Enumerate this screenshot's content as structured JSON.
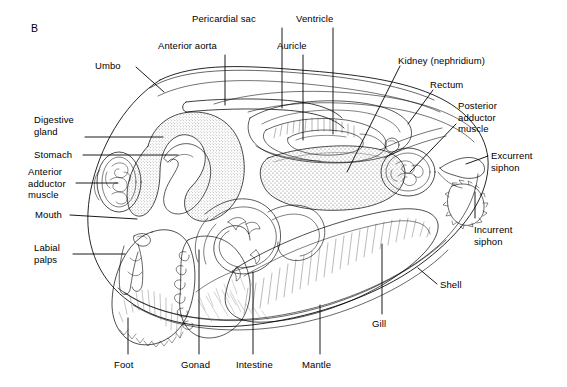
{
  "figure": {
    "panel_letter": "B",
    "background_color": "#ffffff",
    "line_color": "#000000",
    "stipple_color": "#6b6b6b"
  },
  "labels": [
    {
      "id": "pericardial-sac",
      "text": "Pericardial sac",
      "x": 233,
      "y": 14,
      "align": "left",
      "lines": 1
    },
    {
      "id": "ventricle",
      "text": "Ventricle",
      "x": 297,
      "y": 14,
      "align": "left",
      "lines": 1
    },
    {
      "id": "anterior-aorta",
      "text": "Anterior aorta",
      "x": 160,
      "y": 41,
      "align": "left",
      "lines": 1
    },
    {
      "id": "auricle",
      "text": "Auricle",
      "x": 280,
      "y": 41,
      "align": "left",
      "lines": 1
    },
    {
      "id": "umbo",
      "text": "Umbo",
      "x": 95,
      "y": 61,
      "align": "left",
      "lines": 1
    },
    {
      "id": "kidney-nephridium",
      "text": "Kidney (nephridium)",
      "x": 399,
      "y": 56,
      "align": "left",
      "lines": 1
    },
    {
      "id": "rectum",
      "text": "Rectum",
      "x": 432,
      "y": 80,
      "align": "left",
      "lines": 1
    },
    {
      "id": "posterior-adductor-muscle",
      "text": "Posterior\nadductor\nmuscle",
      "x": 459,
      "y": 105,
      "align": "left",
      "lines": 3
    },
    {
      "id": "digestive-gland",
      "text": "Digestive\ngland",
      "x": 35,
      "y": 117,
      "align": "left",
      "lines": 2
    },
    {
      "id": "stomach",
      "text": "Stomach",
      "x": 35,
      "y": 150,
      "align": "left",
      "lines": 1
    },
    {
      "id": "excurrent-siphon",
      "text": "Excurrent\nsiphon",
      "x": 491,
      "y": 150,
      "align": "left",
      "lines": 2
    },
    {
      "id": "anterior-adductor-muscle",
      "text": "Anterior\nadductor\nmuscle",
      "x": 29,
      "y": 168,
      "align": "left",
      "lines": 3
    },
    {
      "id": "mouth",
      "text": "Mouth",
      "x": 36,
      "y": 210,
      "align": "left",
      "lines": 1
    },
    {
      "id": "incurrent-siphon",
      "text": "Incurrent\nsiphon",
      "x": 476,
      "y": 224,
      "align": "left",
      "lines": 2
    },
    {
      "id": "labial-palps",
      "text": "Labial\npalps",
      "x": 35,
      "y": 241,
      "align": "left",
      "lines": 2
    },
    {
      "id": "shell",
      "text": "Shell",
      "x": 440,
      "y": 280,
      "align": "left",
      "lines": 1
    },
    {
      "id": "gill",
      "text": "Gill",
      "x": 371,
      "y": 318,
      "align": "left",
      "lines": 1
    },
    {
      "id": "foot",
      "text": "Foot",
      "x": 115,
      "y": 360,
      "align": "left",
      "lines": 1
    },
    {
      "id": "gonad",
      "text": "Gonad",
      "x": 182,
      "y": 360,
      "align": "left",
      "lines": 1
    },
    {
      "id": "intestine",
      "text": "Intestine",
      "x": 237,
      "y": 360,
      "align": "left",
      "lines": 1
    },
    {
      "id": "mantle",
      "text": "Mantle",
      "x": 303,
      "y": 360,
      "align": "left",
      "lines": 1
    }
  ],
  "structures": [
    "shell-outline",
    "umbo",
    "anterior-aorta",
    "pericardial-sac",
    "auricle",
    "ventricle",
    "kidney-nephridium",
    "rectum",
    "posterior-adductor-muscle",
    "excurrent-siphon",
    "incurrent-siphon",
    "digestive-gland",
    "stomach",
    "anterior-adductor-muscle",
    "mouth",
    "labial-palps",
    "foot",
    "gonad",
    "intestine",
    "mantle",
    "gill"
  ]
}
